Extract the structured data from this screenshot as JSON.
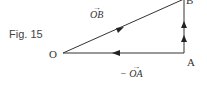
{
  "figure": {
    "label": "Fig. 15",
    "points": {
      "O": "O",
      "A": "A",
      "B": "B"
    },
    "vectors": {
      "OB": {
        "arrow": "→",
        "label": "OB"
      },
      "negOA": {
        "arrow": "→",
        "label": "− OA"
      }
    },
    "colors": {
      "line": "#333333"
    }
  }
}
